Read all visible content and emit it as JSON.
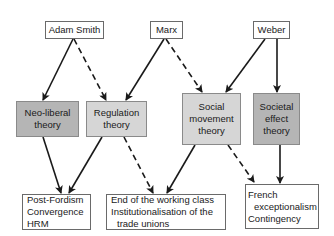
{
  "diagram": {
    "sources": [
      {
        "id": "adam-smith",
        "label": "Adam Smith"
      },
      {
        "id": "marx",
        "label": "Marx"
      },
      {
        "id": "weber",
        "label": "Weber"
      }
    ],
    "theories": [
      {
        "id": "neo-liberal",
        "lines": [
          "Neo-liberal",
          "theory"
        ],
        "shade": "dark"
      },
      {
        "id": "regulation",
        "lines": [
          "Regulation",
          "theory"
        ],
        "shade": "light"
      },
      {
        "id": "social-movement",
        "lines": [
          "Social",
          "movement",
          "theory"
        ],
        "shade": "light"
      },
      {
        "id": "societal-effect",
        "lines": [
          "Societal",
          "effect",
          "theory"
        ],
        "shade": "dark"
      }
    ],
    "outcomes": [
      {
        "id": "post-fordism",
        "lines": [
          "Post-Fordism",
          "Convergence",
          "HRM"
        ]
      },
      {
        "id": "working-class",
        "lines": [
          "End of the working class",
          "Institutionalisation of the",
          "trade unions"
        ]
      },
      {
        "id": "french",
        "lines": [
          "French",
          "exceptionalism",
          "Contingency"
        ]
      }
    ],
    "edges": [
      {
        "from": "adam-smith",
        "to": "neo-liberal",
        "style": "solid"
      },
      {
        "from": "adam-smith",
        "to": "regulation",
        "style": "dashed"
      },
      {
        "from": "marx",
        "to": "regulation",
        "style": "solid"
      },
      {
        "from": "marx",
        "to": "social-movement",
        "style": "dashed"
      },
      {
        "from": "weber",
        "to": "social-movement",
        "style": "solid"
      },
      {
        "from": "weber",
        "to": "societal-effect",
        "style": "solid"
      },
      {
        "from": "neo-liberal",
        "to": "post-fordism",
        "style": "solid"
      },
      {
        "from": "regulation",
        "to": "post-fordism",
        "style": "solid"
      },
      {
        "from": "regulation",
        "to": "working-class",
        "style": "dashed"
      },
      {
        "from": "social-movement",
        "to": "working-class",
        "style": "solid"
      },
      {
        "from": "social-movement",
        "to": "french",
        "style": "dashed"
      },
      {
        "from": "societal-effect",
        "to": "french",
        "style": "solid"
      }
    ],
    "colors": {
      "theory_dark": "#b5b5b5",
      "theory_light": "#d6d6d6",
      "border": "#6a6a6a",
      "arrow": "#1a1a1a"
    }
  }
}
